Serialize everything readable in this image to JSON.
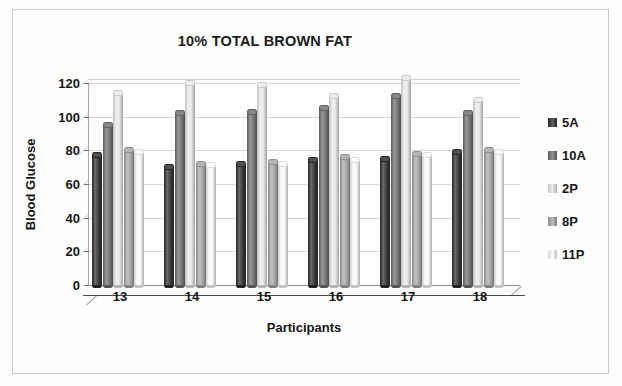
{
  "chart_data": {
    "type": "bar",
    "title": "10% TOTAL BROWN FAT",
    "xlabel": "Participants",
    "ylabel": "Blood Glucose",
    "categories": [
      "13",
      "14",
      "15",
      "16",
      "17",
      "18"
    ],
    "ylim": [
      0,
      120
    ],
    "yticks": [
      0,
      20,
      40,
      60,
      80,
      100,
      120
    ],
    "grid": true,
    "legend_position": "right",
    "style": "3d-cylinder",
    "series": [
      {
        "name": "5A",
        "color": "#2b2b2b",
        "values": [
          77,
          70,
          72,
          74,
          75,
          79
        ]
      },
      {
        "name": "10A",
        "color": "#6e6e6e",
        "values": [
          95,
          102,
          103,
          105,
          112,
          102
        ]
      },
      {
        "name": "2P",
        "color": "#e8e8e8",
        "values": [
          114,
          120,
          119,
          112,
          123,
          110
        ]
      },
      {
        "name": "8P",
        "color": "#a5a5a5",
        "values": [
          80,
          72,
          73,
          76,
          78,
          80
        ]
      },
      {
        "name": "11P",
        "color": "#fafafa",
        "values": [
          79,
          71,
          72,
          74,
          77,
          79
        ]
      }
    ]
  },
  "axis": {
    "ytick_labels": [
      "120",
      "100",
      "80",
      "60",
      "40",
      "20",
      "0"
    ],
    "ylabel": "Blood Glucose",
    "xlabel": "Participants",
    "xtick_labels": [
      "13",
      "14",
      "15",
      "16",
      "17",
      "18"
    ]
  },
  "legend": {
    "items": [
      {
        "label": "5A"
      },
      {
        "label": "10A"
      },
      {
        "label": "2P"
      },
      {
        "label": "8P"
      },
      {
        "label": "11P"
      }
    ]
  },
  "colors": {
    "page_background": "#fdfdfc",
    "page_border": "#c9c9c7",
    "gridline": "#d9d9d7",
    "axis": "#6f6f6d",
    "text": "#161616"
  }
}
